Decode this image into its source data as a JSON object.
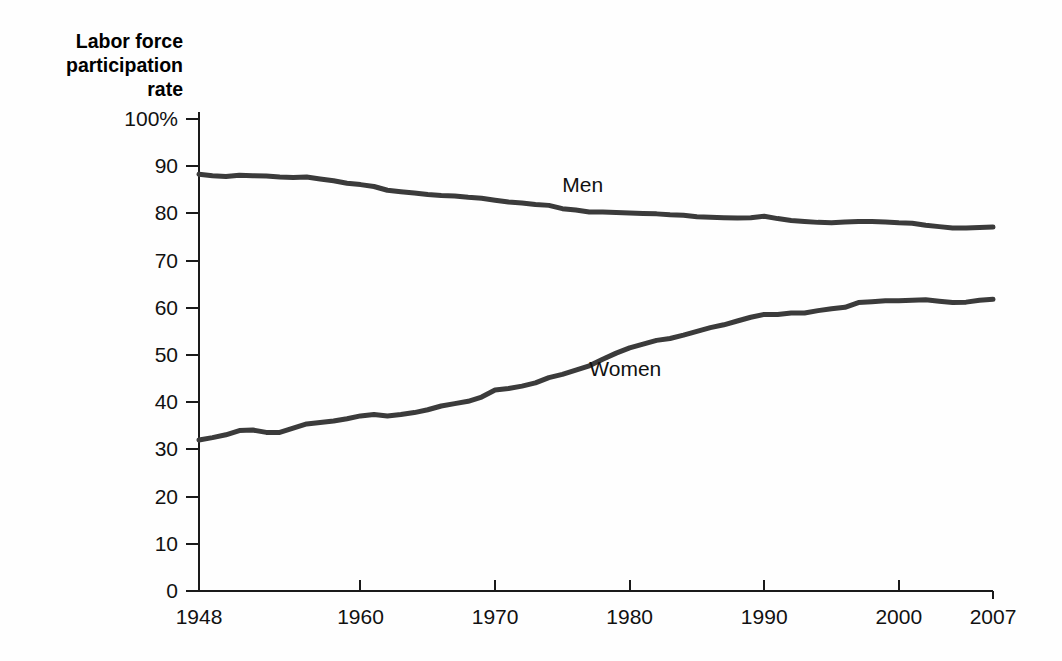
{
  "figure": {
    "background_color": "#fefefe",
    "ink_color": "#3b3b3b",
    "axis_color": "#1a1a1a"
  },
  "chart_data": {
    "type": "line",
    "title": "Labor force participation rate",
    "title_lines": [
      "Labor force",
      "participation",
      "rate"
    ],
    "xlabel": "",
    "ylabel": "Labor force participation rate",
    "xlim": [
      1948,
      2007
    ],
    "ylim": [
      0,
      100
    ],
    "grid": false,
    "legend_position": "inline-annotation",
    "x_ticks": [
      1948,
      1960,
      1970,
      1980,
      1990,
      2000,
      2007
    ],
    "x_tick_labels": [
      "1948",
      "1960",
      "1970",
      "1980",
      "1990",
      "2000",
      "2007"
    ],
    "y_ticks": [
      0,
      10,
      20,
      30,
      40,
      50,
      60,
      70,
      80,
      90,
      100
    ],
    "y_tick_labels": [
      "0",
      "10",
      "20",
      "30",
      "40",
      "50",
      "60",
      "70",
      "80",
      "90",
      "100%"
    ],
    "annotations": [
      {
        "text": "Men",
        "x": 1975,
        "y": 84.5
      },
      {
        "text": "Women",
        "x": 1977,
        "y": 45.5
      }
    ],
    "x": [
      1948,
      1949,
      1950,
      1951,
      1952,
      1953,
      1954,
      1955,
      1956,
      1957,
      1958,
      1959,
      1960,
      1961,
      1962,
      1963,
      1964,
      1965,
      1966,
      1967,
      1968,
      1969,
      1970,
      1971,
      1972,
      1973,
      1974,
      1975,
      1976,
      1977,
      1978,
      1979,
      1980,
      1981,
      1982,
      1983,
      1984,
      1985,
      1986,
      1987,
      1988,
      1989,
      1990,
      1991,
      1992,
      1993,
      1994,
      1995,
      1996,
      1997,
      1998,
      1999,
      2000,
      2001,
      2002,
      2003,
      2004,
      2005,
      2006,
      2007
    ],
    "series": [
      {
        "name": "Men",
        "label": "Men",
        "color": "#3b3b3b",
        "values": [
          88.3,
          88.0,
          87.8,
          88.1,
          88.0,
          87.9,
          87.7,
          87.6,
          87.7,
          87.3,
          86.9,
          86.4,
          86.1,
          85.7,
          84.9,
          84.6,
          84.3,
          84.0,
          83.8,
          83.7,
          83.4,
          83.2,
          82.8,
          82.4,
          82.2,
          81.9,
          81.7,
          81.0,
          80.7,
          80.3,
          80.3,
          80.2,
          80.1,
          80.0,
          79.9,
          79.7,
          79.6,
          79.3,
          79.2,
          79.1,
          79.0,
          79.1,
          79.4,
          78.9,
          78.5,
          78.3,
          78.1,
          78.0,
          78.2,
          78.3,
          78.3,
          78.2,
          78.0,
          77.9,
          77.5,
          77.2,
          76.9,
          76.9,
          77.0,
          77.1
        ]
      },
      {
        "name": "Women",
        "label": "Women",
        "color": "#3b3b3b",
        "values": [
          32.0,
          32.5,
          33.1,
          34.0,
          34.1,
          33.6,
          33.6,
          34.5,
          35.4,
          35.7,
          36.0,
          36.5,
          37.1,
          37.4,
          37.1,
          37.4,
          37.8,
          38.4,
          39.2,
          39.7,
          40.2,
          41.1,
          42.6,
          42.9,
          43.4,
          44.1,
          45.2,
          45.9,
          46.8,
          47.7,
          49.1,
          50.4,
          51.5,
          52.3,
          53.1,
          53.5,
          54.2,
          55.0,
          55.8,
          56.4,
          57.2,
          58.0,
          58.6,
          58.6,
          58.9,
          58.9,
          59.4,
          59.8,
          60.1,
          61.1,
          61.3,
          61.5,
          61.5,
          61.6,
          61.7,
          61.4,
          61.1,
          61.2,
          61.6,
          61.8
        ]
      }
    ]
  }
}
